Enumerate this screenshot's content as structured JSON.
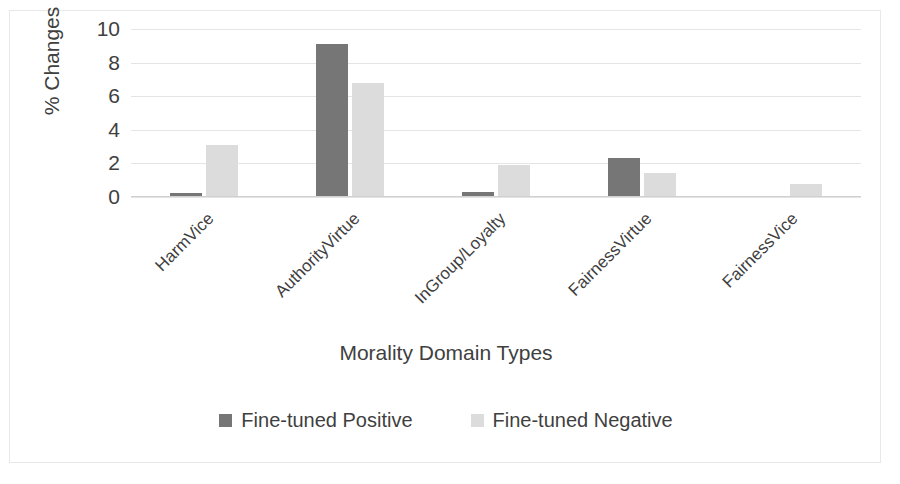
{
  "chart_data": {
    "type": "bar",
    "title": "",
    "xlabel": "Morality Domain Types",
    "ylabel": "% Changes",
    "categories": [
      "HarmVice",
      "AuthorityVirtue",
      "InGroup/Loyalty",
      "FairnessVirtue",
      "FairnessVice"
    ],
    "series": [
      {
        "name": "Fine-tuned Positive",
        "color": "#767676",
        "values": [
          0.25,
          9.1,
          0.3,
          2.3,
          0
        ]
      },
      {
        "name": "Fine-tuned Negative",
        "color": "#dcdcdc",
        "values": [
          3.1,
          6.8,
          1.9,
          1.4,
          0.8
        ]
      }
    ],
    "ylim": [
      0,
      10
    ],
    "yticks": [
      0,
      2,
      4,
      6,
      8,
      10
    ],
    "grid": true,
    "legend_position": "bottom"
  },
  "axes": {
    "y_title": "% Changes",
    "x_title": "Morality Domain Types",
    "y_tick_labels": [
      "10",
      "8",
      "6",
      "4",
      "2",
      "0"
    ]
  },
  "legend": {
    "items": [
      {
        "label": "Fine-tuned Positive",
        "swatch": "dark-gray-swatch"
      },
      {
        "label": "Fine-tuned Negative",
        "swatch": "light-gray-swatch"
      }
    ]
  }
}
